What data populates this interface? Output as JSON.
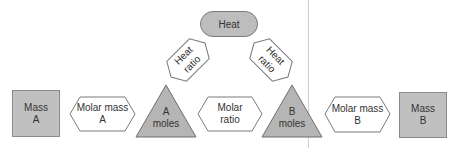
{
  "diagram": {
    "type": "stoichiometry-flow",
    "colors": {
      "shaded_fill": "#c0c0c0",
      "stroke": "#7a7a7a",
      "white_fill": "#ffffff",
      "divider": "#cfcfcf"
    },
    "heat": {
      "label": "Heat"
    },
    "heat_ratio_left": {
      "line1": "Heat",
      "line2": "ratio"
    },
    "heat_ratio_right": {
      "line1": "Heat",
      "line2": "ratio"
    },
    "mass_a": {
      "line1": "Mass",
      "line2": "A"
    },
    "molar_mass_a": {
      "line1": "Molar mass",
      "line2": "A"
    },
    "a_moles": {
      "line1": "A",
      "line2": "moles"
    },
    "molar_ratio": {
      "line1": "Molar",
      "line2": "ratio"
    },
    "b_moles": {
      "line1": "B",
      "line2": "moles"
    },
    "molar_mass_b": {
      "line1": "Molar mass",
      "line2": "B"
    },
    "mass_b": {
      "line1": "Mass",
      "line2": "B"
    }
  }
}
